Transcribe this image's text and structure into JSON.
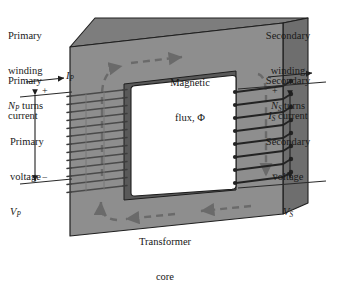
{
  "figure": {
    "type": "labeled-illustration"
  },
  "colors": {
    "core_front": "#8e8e8e",
    "core_top": "#7d7d7d",
    "core_side": "#6e6e6e",
    "core_inner_left": "#5f5f5f",
    "core_inner_dark": "#595959",
    "core_outline": "#1f1f1f",
    "window_fill": "#ffffff",
    "flux_arrow": "#6a6a6a",
    "winding_primary": "#4a4a4a",
    "winding_secondary": "#232323",
    "lead_wire": "#2a2a2a",
    "text": "#1a1a1a",
    "background": "#ffffff"
  },
  "labels": {
    "primary_winding": {
      "line1": "Primary",
      "line2": "winding",
      "line3_symbol": "N",
      "line3_sub": "P",
      "line3_rest": " turns"
    },
    "primary_current": {
      "line1": "Primary",
      "line2": "current",
      "symbol": "I",
      "symbol_sub": "P"
    },
    "primary_voltage": {
      "line1": "Primary",
      "line2": "voltage",
      "symbol": "V",
      "symbol_sub": "P"
    },
    "secondary_winding": {
      "line1": "Secondary",
      "line2": "winding",
      "line3_symbol": "N",
      "line3_sub": "S",
      "line3_rest": " turns"
    },
    "secondary_current": {
      "line1": "Secondary",
      "symbol": "I",
      "symbol_sub": "S",
      "line2_rest": " current"
    },
    "secondary_voltage": {
      "line1": "Secondary",
      "line2": "voltage",
      "symbol": "V",
      "symbol_sub": "S"
    },
    "magnetic_flux": {
      "line1": "Magnetic",
      "line2": "flux, Φ"
    },
    "transformer_core": {
      "line1": "Transformer",
      "line2": "core"
    },
    "polarity": {
      "primary_plus": "+",
      "primary_minus": "−",
      "secondary_plus": "+",
      "secondary_minus": "−"
    }
  }
}
